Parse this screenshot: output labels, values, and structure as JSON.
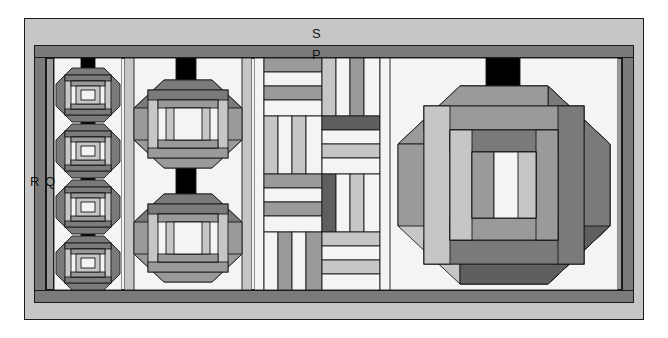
{
  "diagram": {
    "canvas": {
      "width": 668,
      "height": 338,
      "background": "#ffffff"
    },
    "labels": [
      {
        "id": "S",
        "text": "S",
        "x": 312,
        "y": 27,
        "meaning": "outer-border"
      },
      {
        "id": "P",
        "text": "P",
        "x": 312,
        "y": 48,
        "meaning": "inner-border"
      },
      {
        "id": "R",
        "text": "R",
        "x": 30,
        "y": 175,
        "meaning": "side-sashing-outer"
      },
      {
        "id": "Q",
        "text": "Q",
        "x": 45,
        "y": 175,
        "meaning": "side-sashing-inner"
      }
    ],
    "frame": {
      "outer_border_label": "S",
      "outer_border_color": "#c6c6c6",
      "inner_border_label": "P",
      "inner_border_color": "#9a9a9a",
      "sash_label_outer": "R",
      "sash_label_inner": "Q",
      "outline_color": "#1a1a1a",
      "x": 24,
      "y": 18,
      "width": 620,
      "height": 302
    },
    "palette": {
      "white": "#f4f4f4",
      "light_gray": "#c6c6c6",
      "medium_gray": "#9a9a9a",
      "dark_gray": "#7a7a7a",
      "very_dark_gray": "#5f5f5f",
      "black": "#000000",
      "outline": "#1a1a1a"
    },
    "columns": [
      {
        "name": "small-octagon-column",
        "block_type": "octagonal-log-cabin",
        "count": 4,
        "separator": "black-rectangle",
        "x": 56,
        "y": 60,
        "width": 64,
        "height": 226
      },
      {
        "name": "medium-octagon-column",
        "block_type": "octagonal-log-cabin",
        "count": 2,
        "separator": "black-rectangle",
        "x": 126,
        "y": 60,
        "width": 124,
        "height": 226
      },
      {
        "name": "rail-fence-column",
        "block_type": "rail-fence-basketweave",
        "rows": 4,
        "cols": 2,
        "x": 256,
        "y": 60,
        "width": 132,
        "height": 226
      },
      {
        "name": "large-octagon-column",
        "block_type": "octagonal-log-cabin",
        "count": 1,
        "separator": "black-rectangle",
        "x": 392,
        "y": 60,
        "width": 224,
        "height": 226
      }
    ]
  }
}
